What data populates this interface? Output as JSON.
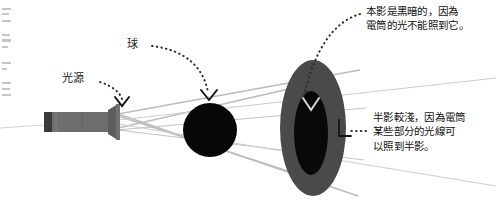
{
  "figure": {
    "background_color": "#ffffff"
  },
  "labels": {
    "light_source": "光源",
    "ball": "球"
  },
  "callouts": {
    "umbra": "本影是黑暗的，因為\n電筒的光不能照到它。",
    "penumbra": "半影較淺，因為電筒\n某些部分的光線可\n以照到半影。"
  },
  "colors": {
    "umbra": "#0a0a0a",
    "penumbra": "#4a4a4a",
    "ball": "#050505",
    "flashlight_body": "#6e6e6e",
    "flashlight_cap": "#3d3d3d",
    "ray": "#b9b9b9",
    "leader": "#2b2b2b",
    "text": "#121212"
  },
  "objects": {
    "flashlight": {
      "name": "電筒",
      "body_x": 44,
      "body_y": 112,
      "body_w": 72,
      "body_h": 20
    },
    "ball": {
      "center_x": 210,
      "center_y": 130,
      "radius": 27
    },
    "screen_penumbra": {
      "center_x": 313,
      "center_y": 128,
      "rx": 33,
      "ry": 68
    },
    "screen_umbra": {
      "center_x": 311,
      "center_y": 133,
      "rx": 17,
      "ry": 42
    }
  }
}
